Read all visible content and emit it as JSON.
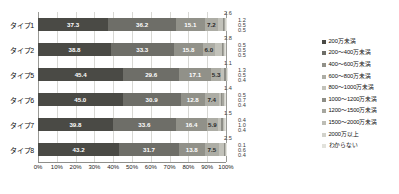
{
  "chart_data": {
    "type": "bar",
    "subtype": "horizontal-stacked-100-percent",
    "title": "",
    "xlabel": "",
    "ylabel": "",
    "xlim": [
      0,
      100
    ],
    "grid": true,
    "legend_position": "right",
    "categories": [
      "タイプ1",
      "タイプ2",
      "タイプ5",
      "タイプ6",
      "タイプ7",
      "タイプ8"
    ],
    "xticks": [
      "0%",
      "10%",
      "20%",
      "30%",
      "40%",
      "50%",
      "60%",
      "70%",
      "80%",
      "90%",
      "100%"
    ],
    "xtick_values": [
      0,
      10,
      20,
      30,
      40,
      50,
      60,
      70,
      80,
      90,
      100
    ],
    "series": [
      {
        "name": "200万未満",
        "color": "#4a4a45",
        "values": [
          37.3,
          38.8,
          45.4,
          45.0,
          39.8,
          43.2
        ]
      },
      {
        "name": "200～400万未満",
        "color": "#6e6e68",
        "values": [
          36.2,
          33.3,
          29.6,
          30.9,
          33.6,
          31.7
        ]
      },
      {
        "name": "400～600万未満",
        "color": "#919189",
        "values": [
          15.1,
          15.8,
          17.1,
          12.8,
          16.4,
          13.8
        ]
      },
      {
        "name": "600～800万未満",
        "color": "#adada5",
        "values": [
          7.2,
          6.0,
          5.3,
          7.4,
          5.9,
          7.5
        ]
      },
      {
        "name": "800～1000万未満",
        "color": "#c2c2ba",
        "values": [
          2.6,
          3.8,
          1.3,
          1.4,
          1.5,
          2.5
        ]
      },
      {
        "name": "1000～1200万未満",
        "color": "#8d8d86",
        "values": [
          0.5,
          0.5,
          1.1,
          0.5,
          1.0,
          0.6
        ]
      },
      {
        "name": "1200～1500万未満",
        "color": "#a6a69e",
        "values": [
          0.5,
          0.5,
          0.4,
          0.7,
          0.4,
          0.4
        ]
      },
      {
        "name": "1500～2000万未満",
        "color": "#bdbdb5",
        "values": [
          0.2,
          0.5,
          0.3,
          0.4,
          0.3,
          0.2
        ]
      },
      {
        "name": "2000万以上",
        "color": "#d2d2cb",
        "values": [
          0.2,
          0.4,
          0.1,
          0.4,
          0.5,
          0.1
        ]
      },
      {
        "name": "わからない",
        "color": "#e2e2dc",
        "values": [
          0.2,
          0.4,
          0.4,
          0.6,
          0.6,
          0.1
        ]
      }
    ],
    "inline_labels": {
      "タイプ1": [
        "37.3",
        "36.2",
        "15.1",
        "7.2"
      ],
      "タイプ2": [
        "38.8",
        "33.3",
        "15.8",
        "6.0"
      ],
      "タイプ5": [
        "45.4",
        "29.6",
        "17.1",
        "5.3"
      ],
      "タイプ6": [
        "45.0",
        "30.9",
        "12.8",
        "7.4"
      ],
      "タイプ7": [
        "39.8",
        "33.6",
        "16.4",
        "5.9"
      ],
      "タイプ8": [
        "43.2",
        "31.7",
        "13.8",
        "7.5"
      ]
    },
    "callout_labels": {
      "タイプ1": [
        "2.6",
        "1.2",
        "0.5",
        "0.5"
      ],
      "タイプ2": [
        "3.8",
        "0.5",
        "0.5",
        "0.5"
      ],
      "タイプ5": [
        "1.1",
        "1.3",
        "0.5",
        "0.4"
      ],
      "タイプ6": [
        "1.4",
        "0.5",
        "0.7",
        "0.4"
      ],
      "タイプ7": [
        "1.5",
        "0.4",
        "1.0",
        "0.4"
      ],
      "タイプ8": [
        "2.5",
        "0.1",
        "0.6",
        "0.4"
      ]
    }
  },
  "legend": {
    "items": [
      {
        "label": "200万未満"
      },
      {
        "label": "200～400万未満"
      },
      {
        "label": "400～600万未満"
      },
      {
        "label": "600～800万未満"
      },
      {
        "label": "800～1000万未満"
      },
      {
        "label": "1000～1200万未満"
      },
      {
        "label": "1200～1500万未満"
      },
      {
        "label": "1500～2000万未満"
      },
      {
        "label": "2000万以上"
      },
      {
        "label": "わからない"
      }
    ]
  }
}
